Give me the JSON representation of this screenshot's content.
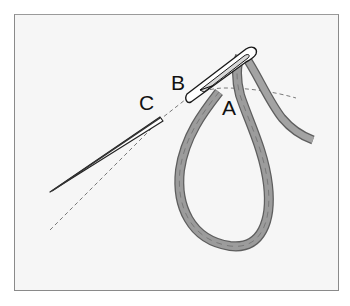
{
  "figure": {
    "labels": {
      "a": "A",
      "b": "B",
      "c": "C"
    },
    "colors": {
      "thread": "#9a9a9a",
      "thread_edge": "#5e5e5e",
      "needle": "#222222",
      "background": "#f6f6f6",
      "frame": "#8a8a8a",
      "dashed_line": "#777777"
    }
  }
}
